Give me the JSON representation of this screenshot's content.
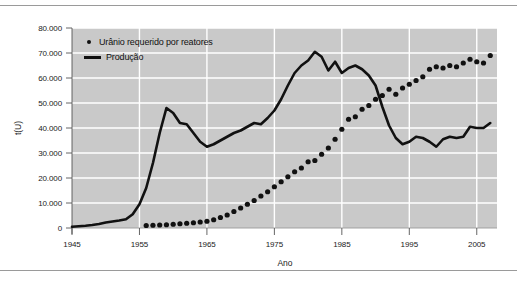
{
  "chart_data": {
    "type": "line",
    "title": "",
    "xlabel": "Ano",
    "ylabel": "t(U)",
    "xlim": [
      1945,
      2008
    ],
    "ylim": [
      0,
      80000
    ],
    "grid": true,
    "legend_position": "top-left-inside",
    "xticks": [
      1945,
      1955,
      1965,
      1975,
      1985,
      1995,
      2005
    ],
    "xtick_labels": [
      "1945",
      "1955",
      "1965",
      "1975",
      "1985",
      "1995",
      "2005"
    ],
    "yticks": [
      0,
      10000,
      20000,
      30000,
      40000,
      50000,
      60000,
      70000,
      80000
    ],
    "ytick_labels": [
      "0",
      "10.000",
      "20.000",
      "30.000",
      "40.000",
      "50.000",
      "60.000",
      "70.000",
      "80.000"
    ],
    "plot_bgcolor": "#c9c9c9",
    "gridcolor": "#ffffff",
    "series": [
      {
        "name": "Urânio requerido por reatores",
        "style": "dotted",
        "marker": "circle",
        "color": "#111111",
        "x": [
          1956,
          1957,
          1958,
          1959,
          1960,
          1961,
          1962,
          1963,
          1964,
          1965,
          1966,
          1967,
          1968,
          1969,
          1970,
          1971,
          1972,
          1973,
          1974,
          1975,
          1976,
          1977,
          1978,
          1979,
          1980,
          1981,
          1982,
          1983,
          1984,
          1985,
          1986,
          1987,
          1988,
          1989,
          1990,
          1991,
          1992,
          1993,
          1994,
          1995,
          1996,
          1997,
          1998,
          1999,
          2000,
          2001,
          2002,
          2003,
          2004,
          2005,
          2006,
          2007
        ],
        "values": [
          1000,
          1100,
          1200,
          1300,
          1500,
          1700,
          1900,
          2100,
          2400,
          2700,
          3300,
          4200,
          5200,
          6600,
          8000,
          9500,
          11000,
          12800,
          14500,
          16500,
          18500,
          20500,
          22500,
          24000,
          26500,
          27000,
          29500,
          32000,
          35500,
          39500,
          43500,
          44500,
          47500,
          49000,
          51500,
          53000,
          55500,
          53500,
          56000,
          57500,
          59000,
          60500,
          63500,
          64500,
          64000,
          65000,
          64500,
          66000,
          67500,
          66500,
          66000,
          69000
        ]
      },
      {
        "name": "Produção",
        "style": "solid",
        "color": "#111111",
        "x": [
          1945,
          1946,
          1947,
          1948,
          1949,
          1950,
          1951,
          1952,
          1953,
          1954,
          1955,
          1956,
          1957,
          1958,
          1959,
          1960,
          1961,
          1962,
          1963,
          1964,
          1965,
          1966,
          1967,
          1968,
          1969,
          1970,
          1971,
          1972,
          1973,
          1974,
          1975,
          1976,
          1977,
          1978,
          1979,
          1980,
          1981,
          1982,
          1983,
          1984,
          1985,
          1986,
          1987,
          1988,
          1989,
          1990,
          1991,
          1992,
          1993,
          1994,
          1995,
          1996,
          1997,
          1998,
          1999,
          2000,
          2001,
          2002,
          2003,
          2004,
          2005,
          2006,
          2007
        ],
        "values": [
          500,
          700,
          900,
          1200,
          1600,
          2200,
          2600,
          3000,
          3500,
          5500,
          9500,
          16000,
          26000,
          38000,
          48000,
          46000,
          42000,
          41500,
          38000,
          34500,
          32500,
          33500,
          35000,
          36500,
          38000,
          39000,
          40500,
          42000,
          41500,
          44000,
          47000,
          51500,
          57000,
          62000,
          65000,
          67000,
          70500,
          68500,
          63000,
          66500,
          62000,
          64000,
          65000,
          63500,
          61000,
          57000,
          48500,
          41000,
          36000,
          33500,
          34500,
          36500,
          36000,
          34500,
          32500,
          35500,
          36500,
          36000,
          36500,
          40500,
          40000,
          40000,
          42000
        ]
      }
    ]
  },
  "legend": {
    "items": [
      {
        "label": "Urânio requerido por reatores",
        "marker": "dot"
      },
      {
        "label": "Produção",
        "marker": "line"
      }
    ]
  },
  "axes": {
    "y_title": "t(U)",
    "x_title": "Ano"
  }
}
